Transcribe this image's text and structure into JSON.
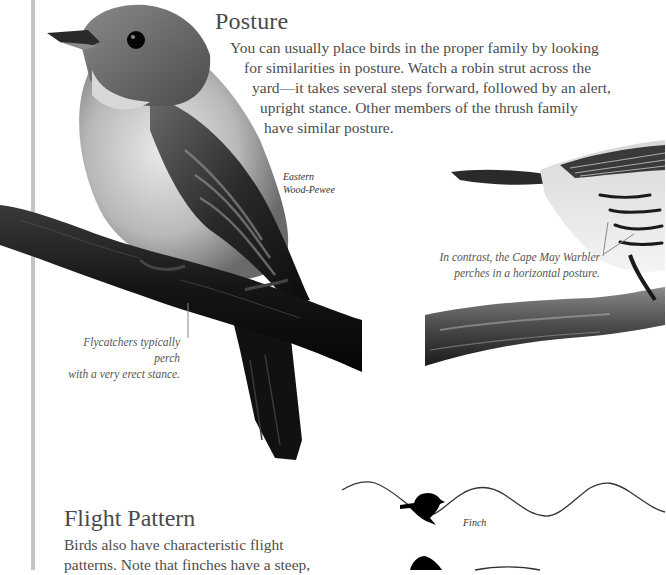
{
  "page": {
    "sections": [
      {
        "id": "posture",
        "heading": "Posture",
        "body_lines": [
          "You can usually place birds in the proper family by looking",
          "for similarities in posture. Watch a robin strut across the",
          "yard—it takes several steps forward, followed by an alert,",
          "upright stance. Other members of the thrush family",
          "have similar posture."
        ]
      },
      {
        "id": "flight-pattern",
        "heading": "Flight Pattern",
        "body_lines": [
          "Birds also have characteristic flight",
          "patterns. Note that finches have a steep,"
        ]
      }
    ],
    "images": {
      "pewee": {
        "label_lines": [
          "Eastern",
          "Wood-Pewee"
        ],
        "caption_lines": [
          "Flycatchers typically perch",
          "with a very erect stance."
        ]
      },
      "warbler": {
        "caption_lines": [
          "In contrast, the Cape May Warbler",
          "perches in a horizontal posture."
        ]
      },
      "flight_diagram": {
        "finch_label": "Finch"
      }
    },
    "colors": {
      "margin_rule": "#c4c4c4",
      "text": "#4d4d4d",
      "background": "#ffffff"
    }
  }
}
